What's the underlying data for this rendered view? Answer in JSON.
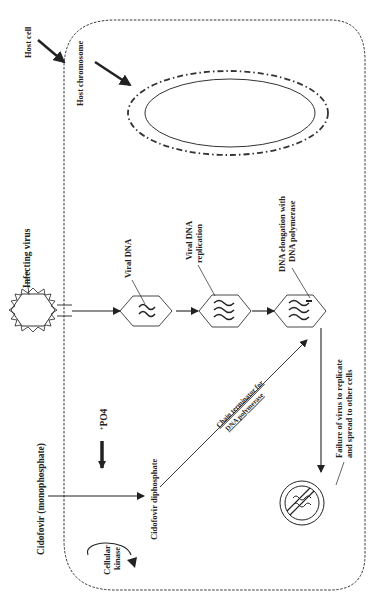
{
  "diagram": {
    "title": "",
    "labels": {
      "host_cell": "Host cell",
      "host_chromosome": "Host chromosome",
      "infecting_virus": "Infecting virus",
      "viral_dna": "Viral DNA",
      "viral_dna_replication_1": "Viral DNA",
      "viral_dna_replication_2": "replication",
      "dna_elongation_1": "DNA elongation with",
      "dna_elongation_2": "DNA polymerase",
      "cidofovir_mono": "Cidofovir (monophosphate)",
      "po4": "PO4",
      "po4_prefix": "+",
      "cidofovir_di": "Cidofovir diphosphate",
      "cellular_kinase_1": "Cellular",
      "cellular_kinase_2": "kinase",
      "chain_terminator_1": "Chain terminator for",
      "chain_terminator_2": "DNA polymerase",
      "failure_1": "Failure of virus to replicate",
      "failure_2": "and spread to other cells"
    },
    "colors": {
      "stroke": "#222222",
      "background": "#ffffff"
    },
    "nodes": [
      {
        "id": "host-cell",
        "shape": "rounded-rect-dashed"
      },
      {
        "id": "host-chromosome",
        "shape": "ellipse-double"
      },
      {
        "id": "infecting-virus",
        "shape": "star-hexagon"
      },
      {
        "id": "viral-dna",
        "shape": "hexagon",
        "strands": 2
      },
      {
        "id": "viral-dna-replication",
        "shape": "hexagon",
        "strands": 3
      },
      {
        "id": "dna-elongation",
        "shape": "hexagon",
        "strands": 3
      },
      {
        "id": "failure",
        "shape": "prohibition-circle"
      }
    ],
    "edges": [
      {
        "from": "infecting-virus",
        "to": "viral-dna"
      },
      {
        "from": "viral-dna",
        "to": "viral-dna-replication"
      },
      {
        "from": "viral-dna-replication",
        "to": "dna-elongation"
      },
      {
        "from": "dna-elongation",
        "to": "failure"
      },
      {
        "from": "cidofovir-mono",
        "to": "cidofovir-di"
      },
      {
        "from": "cidofovir-di",
        "to": "dna-elongation",
        "label": "Chain terminator for DNA polymerase"
      }
    ]
  }
}
